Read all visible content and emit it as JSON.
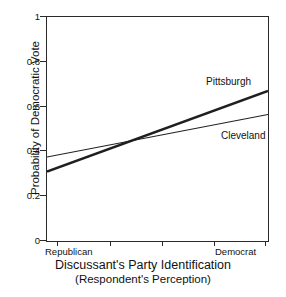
{
  "figure": {
    "background_color": "#ffffff",
    "line_color": "#1f1f1f"
  },
  "axis": {
    "y_title": "Probability of Democratic Vote",
    "x_title_line1": "Discussant's Party Identification",
    "x_title_line2": "(Respondent's Perception)",
    "y_ticks": [
      "1",
      "0.8",
      "0.6",
      "0.4",
      "0.2",
      "0"
    ],
    "x_tick_left": "Republican",
    "x_tick_right": "Democrat"
  },
  "labels": {
    "pittsburgh": "Pittsburgh",
    "cleveland": "Cleveland"
  },
  "chart_data": {
    "type": "line",
    "title": "",
    "xlabel": "Discussant's Party Identification (Respondent's Perception)",
    "ylabel": "Probability of Democratic Vote",
    "xlim": [
      0,
      1
    ],
    "ylim": [
      0,
      1
    ],
    "grid": false,
    "legend": "inline-right-of-line-ends",
    "x_tick_labels": [
      "Republican",
      "Democrat"
    ],
    "x_tick_positions": [
      0,
      1
    ],
    "x_minor_tick_positions": [
      0.05,
      0.29,
      0.52,
      0.76,
      1.0
    ],
    "y_tick_labels": [
      "0",
      "0.2",
      "0.4",
      "0.6",
      "0.8",
      "1"
    ],
    "y_tick_positions": [
      0,
      0.2,
      0.4,
      0.6,
      0.8,
      1
    ],
    "x": [
      0,
      1
    ],
    "series": [
      {
        "name": "Pittsburgh",
        "values": [
          0.31,
          0.67
        ],
        "linewidth": 2.6,
        "color": "#1f1f1f"
      },
      {
        "name": "Cleveland",
        "values": [
          0.375,
          0.565
        ],
        "linewidth": 1.1,
        "color": "#1f1f1f"
      }
    ],
    "annotations": [
      {
        "text": "Pittsburgh",
        "x": 0.78,
        "y": 0.74
      },
      {
        "text": "Cleveland",
        "x": 0.85,
        "y": 0.5
      }
    ]
  }
}
